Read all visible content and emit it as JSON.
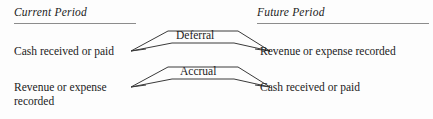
{
  "diagram": {
    "background_color": "#fdfdfd",
    "line_color": "#3a3a3a",
    "rule_color": "#8c8c8c",
    "text_color": "#1b1b1b",
    "columns": [
      {
        "id": "current",
        "heading": "Current Period"
      },
      {
        "id": "future",
        "heading": "Future Period"
      }
    ],
    "flows": [
      {
        "id": "deferral",
        "caption": "Deferral",
        "left_label": "Cash received or paid",
        "right_label": "Revenue or expense recorded"
      },
      {
        "id": "accrual",
        "caption": "Accrual",
        "left_label": "Revenue or expense\nrecorded",
        "right_label": "Cash received or paid"
      }
    ]
  }
}
